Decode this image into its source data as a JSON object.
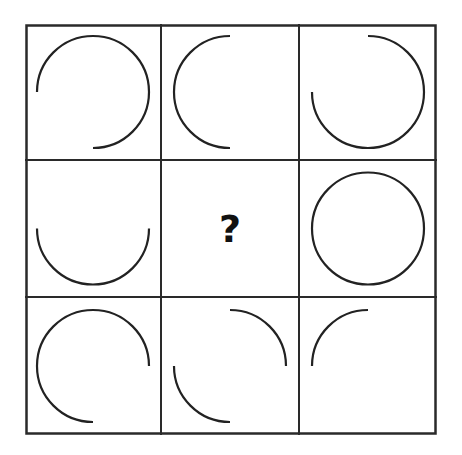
{
  "puzzle": {
    "description": "3x3 matrix of circle arc fragments with one missing cell",
    "question_mark": "?",
    "stroke_color": "#222222",
    "grid_color": "#2a2a2a",
    "cells": [
      {
        "row": 0,
        "col": 0,
        "arcs": [
          [
            180,
            450
          ]
        ]
      },
      {
        "row": 0,
        "col": 1,
        "arcs": [
          [
            90,
            270
          ]
        ]
      },
      {
        "row": 0,
        "col": 2,
        "arcs": [
          [
            270,
            540
          ]
        ]
      },
      {
        "row": 1,
        "col": 0,
        "arcs": [
          [
            0,
            180
          ]
        ]
      },
      {
        "row": 1,
        "col": 1,
        "missing": true
      },
      {
        "row": 1,
        "col": 2,
        "arcs": [
          [
            0,
            360
          ]
        ]
      },
      {
        "row": 2,
        "col": 0,
        "arcs": [
          [
            90,
            360
          ]
        ]
      },
      {
        "row": 2,
        "col": 1,
        "arcs": [
          [
            270,
            360
          ],
          [
            90,
            180
          ]
        ]
      },
      {
        "row": 2,
        "col": 2,
        "arcs": [
          [
            180,
            270
          ]
        ]
      }
    ]
  }
}
